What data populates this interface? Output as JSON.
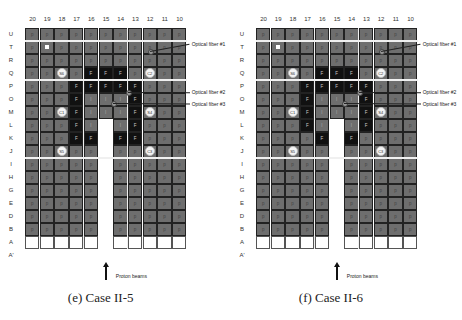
{
  "columns": [
    "20",
    "19",
    "18",
    "17",
    "16",
    "15",
    "14",
    "13",
    "12",
    "11",
    "10"
  ],
  "rows": [
    "U",
    "T",
    "R",
    "Q",
    "P",
    "O",
    "M",
    "L",
    "K",
    "J",
    "I",
    "H",
    "G",
    "E",
    "D",
    "B",
    "A",
    "A'"
  ],
  "legend_codes": {
    "p": "fuel (gray)",
    "F": "fuel (black)",
    "I": "irradiation (gray)"
  },
  "panels": [
    {
      "caption": "(e) Case II-5",
      "beam_label": "Proton beams",
      "fibers": [
        {
          "label": "Optical fiber #1",
          "row": "T",
          "col": "12"
        },
        {
          "label": "Optical fiber #2",
          "row": "P",
          "col": "14"
        },
        {
          "label": "Optical fiber #3",
          "row": "O",
          "col": "15"
        }
      ],
      "grid": [
        [
          "p",
          "p",
          "p",
          "p",
          "p",
          "p",
          "p",
          "p",
          "p",
          "p",
          "p"
        ],
        [
          "p",
          "W",
          "p",
          "p",
          "p",
          "p",
          "p",
          "p",
          "p",
          "p",
          "p"
        ],
        [
          "p",
          "p",
          "p",
          "p",
          "p",
          "p",
          "p",
          "p",
          "p",
          "p",
          "p"
        ],
        [
          "p",
          "p",
          "S6",
          "p",
          "F",
          "F",
          "F",
          "p",
          "C2",
          "p",
          "p"
        ],
        [
          "p",
          "p",
          "p",
          "F",
          "F",
          "F",
          "F",
          "F",
          "p",
          "p",
          "p"
        ],
        [
          "p",
          "p",
          "p",
          "F",
          "I",
          "I",
          "I",
          "F",
          "p",
          "p",
          "p"
        ],
        [
          "p",
          "p",
          "C1",
          "F",
          "I",
          "I",
          "I",
          "F",
          "S4",
          "p",
          "p"
        ],
        [
          "p",
          "p",
          "p",
          "F",
          "I",
          "X",
          "I",
          "F",
          "p",
          "p",
          "p"
        ],
        [
          "p",
          "p",
          "p",
          "F",
          "F",
          "X",
          "F",
          "F",
          "p",
          "p",
          "p"
        ],
        [
          "p",
          "p",
          "S5",
          "p",
          "p",
          "X",
          "p",
          "p",
          "C3",
          "p",
          "p"
        ],
        [
          "p",
          "p",
          "p",
          "p",
          "p",
          "X",
          "p",
          "p",
          "p",
          "p",
          "p"
        ],
        [
          "p",
          "p",
          "p",
          "p",
          "p",
          "X",
          "p",
          "p",
          "p",
          "p",
          "p"
        ],
        [
          "p",
          "p",
          "p",
          "p",
          "p",
          "X",
          "p",
          "p",
          "p",
          "p",
          "p"
        ],
        [
          "p",
          "p",
          "p",
          "p",
          "p",
          "X",
          "p",
          "p",
          "p",
          "p",
          "p"
        ],
        [
          "p",
          "p",
          "p",
          "p",
          "p",
          "X",
          "p",
          "p",
          "p",
          "p",
          "p"
        ],
        [
          "p",
          "p",
          "p",
          "p",
          "p",
          "X",
          "p",
          "p",
          "p",
          "p",
          "p"
        ],
        [
          "e",
          "e",
          "e",
          "e",
          "e",
          "X",
          "e",
          "e",
          "e",
          "e",
          "e"
        ]
      ]
    },
    {
      "caption": "(f) Case II-6",
      "beam_label": "Proton beams",
      "fibers": [
        {
          "label": "Optical fiber #1",
          "row": "T",
          "col": "12"
        },
        {
          "label": "Optical fiber #2",
          "row": "P",
          "col": "14"
        },
        {
          "label": "Optical fiber #3",
          "row": "O",
          "col": "15"
        }
      ],
      "grid": [
        [
          "p",
          "p",
          "p",
          "p",
          "p",
          "p",
          "p",
          "p",
          "p",
          "p",
          "p"
        ],
        [
          "p",
          "W",
          "p",
          "p",
          "p",
          "p",
          "p",
          "p",
          "p",
          "p",
          "p"
        ],
        [
          "p",
          "p",
          "p",
          "p",
          "p",
          "p",
          "p",
          "p",
          "p",
          "p",
          "p"
        ],
        [
          "p",
          "p",
          "S6",
          "p",
          "F",
          "F",
          "F",
          "p",
          "C2",
          "p",
          "p"
        ],
        [
          "p",
          "p",
          "p",
          "F",
          "F",
          "F",
          "F",
          "F",
          "p",
          "p",
          "p"
        ],
        [
          "p",
          "p",
          "p",
          "F",
          "I",
          "I",
          "I",
          "F",
          "p",
          "p",
          "p"
        ],
        [
          "p",
          "p",
          "C1",
          "F",
          "I",
          "I",
          "I",
          "F",
          "S4",
          "p",
          "p"
        ],
        [
          "p",
          "p",
          "p",
          "F",
          "I",
          "X",
          "I",
          "F",
          "p",
          "p",
          "p"
        ],
        [
          "p",
          "p",
          "p",
          "p",
          "F",
          "X",
          "F",
          "p",
          "p",
          "p",
          "p"
        ],
        [
          "p",
          "p",
          "S5",
          "p",
          "p",
          "X",
          "p",
          "p",
          "C3",
          "p",
          "p"
        ],
        [
          "p",
          "p",
          "p",
          "p",
          "p",
          "X",
          "p",
          "p",
          "p",
          "p",
          "p"
        ],
        [
          "p",
          "p",
          "p",
          "p",
          "p",
          "X",
          "p",
          "p",
          "p",
          "p",
          "p"
        ],
        [
          "p",
          "p",
          "p",
          "p",
          "p",
          "X",
          "p",
          "p",
          "p",
          "p",
          "p"
        ],
        [
          "p",
          "p",
          "p",
          "p",
          "p",
          "X",
          "p",
          "p",
          "p",
          "p",
          "p"
        ],
        [
          "p",
          "p",
          "p",
          "p",
          "p",
          "X",
          "p",
          "p",
          "p",
          "p",
          "p"
        ],
        [
          "p",
          "p",
          "p",
          "p",
          "p",
          "X",
          "p",
          "p",
          "p",
          "p",
          "p"
        ],
        [
          "e",
          "e",
          "e",
          "e",
          "e",
          "X",
          "e",
          "e",
          "e",
          "e",
          "e"
        ]
      ]
    }
  ]
}
